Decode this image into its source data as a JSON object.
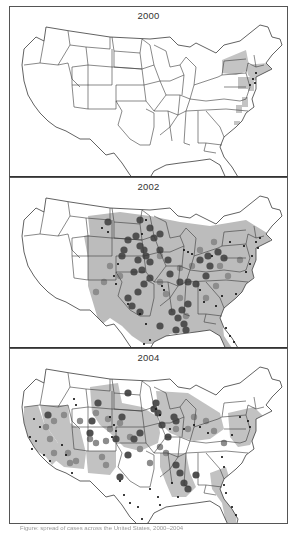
{
  "figure": {
    "panels": [
      {
        "year_label": "2000",
        "fill_color": "#c4c4c4",
        "shaded_regions": [
          {
            "name": "new-york",
            "points": "212,45 236,35 240,55 226,60 212,58"
          },
          {
            "name": "new-england",
            "points": "236,50 258,48 262,56 244,66 238,60"
          },
          {
            "name": "new-jersey",
            "points": "238,62 244,62 244,76 238,76"
          },
          {
            "name": "pennsylvania-east",
            "points": "228,62 238,62 238,74 228,74"
          },
          {
            "name": "maryland-spot",
            "points": "232,82 238,82 238,92 232,92"
          },
          {
            "name": "virginia-spot",
            "points": "226,90 232,90 232,98 226,98"
          },
          {
            "name": "nc-spot",
            "points": "224,106 230,106 230,110 224,110"
          }
        ],
        "circles_medium": [],
        "circles_dark": [],
        "dots": [
          [
            243,
            64
          ],
          [
            245,
            68
          ],
          [
            240,
            70
          ],
          [
            246,
            58
          ]
        ]
      },
      {
        "year_label": "2002",
        "fill_color": "#bcbcbc",
        "shaded_regions": [
          {
            "name": "central-east",
            "points": "78,30 110,26 140,30 170,36 200,40 236,34 262,50 256,64 246,80 242,96 238,110 226,120 212,132 214,150 226,168 210,170 200,150 182,146 160,148 150,158 134,158 122,150 112,140 100,132 90,140 84,120 78,100 78,70 80,50"
          },
          {
            "name": "west-patch",
            "points": "74,50 92,46 92,70 78,72"
          }
        ],
        "circles_medium": [
          [
            100,
            80
          ],
          [
            110,
            90
          ],
          [
            150,
            96
          ],
          [
            170,
            82
          ],
          [
            182,
            80
          ],
          [
            156,
            108
          ],
          [
            170,
            112
          ],
          [
            176,
            130
          ],
          [
            196,
            112
          ],
          [
            206,
            100
          ],
          [
            218,
            90
          ],
          [
            190,
            64
          ],
          [
            204,
            56
          ],
          [
            150,
            70
          ],
          [
            94,
            96
          ],
          [
            86,
            106
          ],
          [
            210,
            80
          ],
          [
            230,
            74
          ]
        ],
        "circles_dark": [
          [
            98,
            36
          ],
          [
            130,
            34
          ],
          [
            140,
            42
          ],
          [
            126,
            50
          ],
          [
            118,
            54
          ],
          [
            130,
            60
          ],
          [
            134,
            64
          ],
          [
            136,
            70
          ],
          [
            128,
            74
          ],
          [
            140,
            76
          ],
          [
            124,
            86
          ],
          [
            132,
            84
          ],
          [
            140,
            92
          ],
          [
            134,
            98
          ],
          [
            128,
            106
          ],
          [
            118,
            112
          ],
          [
            122,
            120
          ],
          [
            130,
            126
          ],
          [
            168,
            132
          ],
          [
            172,
            124
          ],
          [
            178,
            118
          ],
          [
            174,
            138
          ],
          [
            166,
            144
          ],
          [
            162,
            126
          ],
          [
            150,
            140
          ],
          [
            176,
            144
          ],
          [
            158,
            74
          ],
          [
            150,
            64
          ],
          [
            114,
            64
          ],
          [
            112,
            70
          ],
          [
            144,
            52
          ],
          [
            150,
            48
          ],
          [
            190,
            74
          ],
          [
            198,
            70
          ],
          [
            200,
            80
          ],
          [
            208,
            66
          ],
          [
            214,
            72
          ],
          [
            196,
            90
          ],
          [
            186,
            98
          ],
          [
            178,
            96
          ],
          [
            170,
            96
          ],
          [
            160,
            88
          ]
        ],
        "dots": [
          [
            92,
            42
          ],
          [
            98,
            46
          ],
          [
            108,
            78
          ],
          [
            104,
            90
          ],
          [
            106,
            98
          ],
          [
            136,
            34
          ],
          [
            132,
            48
          ],
          [
            174,
            64
          ],
          [
            178,
            66
          ],
          [
            182,
            68
          ],
          [
            202,
            70
          ],
          [
            220,
            56
          ],
          [
            234,
            60
          ],
          [
            246,
            56
          ],
          [
            250,
            52
          ],
          [
            248,
            62
          ],
          [
            242,
            70
          ],
          [
            240,
            78
          ],
          [
            236,
            86
          ],
          [
            226,
            108
          ],
          [
            212,
            110
          ],
          [
            206,
            120
          ],
          [
            220,
            150
          ],
          [
            224,
            156
          ],
          [
            226,
            164
          ],
          [
            216,
            142
          ],
          [
            118,
            118
          ],
          [
            130,
            128
          ],
          [
            136,
            138
          ],
          [
            140,
            154
          ],
          [
            134,
            158
          ],
          [
            152,
            100
          ],
          [
            154,
            104
          ],
          [
            190,
            104
          ],
          [
            194,
            116
          ]
        ]
      },
      {
        "year_label": "2004",
        "fill_color": "#c2c2c2",
        "shaded_regions": [
          {
            "name": "california",
            "points": "14,50 28,48 34,66 48,86 50,100 42,108 36,100 24,92 18,80 14,66"
          },
          {
            "name": "nevada-arizona",
            "points": "30,48 58,48 60,66 70,72 76,96 74,112 54,110 44,102 48,86 34,66"
          },
          {
            "name": "new-mexico",
            "points": "76,94 106,94 106,110 100,118 78,116"
          },
          {
            "name": "plains",
            "points": "80,30 108,26 112,46 132,50 148,60 150,76 148,86 130,94 114,90 100,76 90,68 82,56"
          },
          {
            "name": "midwest",
            "points": "146,34 178,36 210,56 214,72 200,82 184,84 170,80 160,76 150,66"
          },
          {
            "name": "south-central",
            "points": "150,96 176,96 180,116 186,130 176,140 162,140 156,126 150,110"
          },
          {
            "name": "east-coast",
            "points": "218,56 244,50 254,60 248,74 240,88 228,90 220,80"
          },
          {
            "name": "florida-ga",
            "points": "200,116 216,110 222,130 228,150 226,166 216,166 212,146 202,132"
          }
        ],
        "circles_medium": [
          [
            36,
            70
          ],
          [
            40,
            82
          ],
          [
            44,
            96
          ],
          [
            58,
            96
          ],
          [
            60,
            106
          ],
          [
            66,
            104
          ],
          [
            80,
            82
          ],
          [
            86,
            86
          ],
          [
            96,
            84
          ],
          [
            92,
            100
          ],
          [
            96,
            108
          ],
          [
            100,
            72
          ],
          [
            110,
            66
          ],
          [
            120,
            80
          ],
          [
            130,
            92
          ],
          [
            140,
            106
          ],
          [
            150,
            90
          ],
          [
            156,
            96
          ],
          [
            166,
            72
          ],
          [
            178,
            72
          ],
          [
            184,
            60
          ],
          [
            196,
            64
          ],
          [
            204,
            74
          ],
          [
            214,
            86
          ],
          [
            44,
            64
          ],
          [
            54,
            58
          ],
          [
            70,
            64
          ],
          [
            86,
            56
          ],
          [
            98,
            62
          ]
        ],
        "circles_dark": [
          [
            118,
            36
          ],
          [
            88,
            46
          ],
          [
            112,
            60
          ],
          [
            38,
            58
          ],
          [
            82,
            64
          ],
          [
            80,
            76
          ],
          [
            124,
            82
          ],
          [
            130,
            76
          ],
          [
            118,
            98
          ],
          [
            106,
            82
          ],
          [
            110,
            120
          ],
          [
            152,
            68
          ],
          [
            146,
            46
          ],
          [
            164,
            60
          ],
          [
            166,
            64
          ],
          [
            158,
            80
          ],
          [
            166,
            108
          ],
          [
            170,
            116
          ],
          [
            174,
            126
          ],
          [
            178,
            132
          ],
          [
            186,
            118
          ],
          [
            148,
            56
          ],
          [
            144,
            52
          ]
        ],
        "dots": [
          [
            24,
            62
          ],
          [
            30,
            70
          ],
          [
            20,
            80
          ],
          [
            26,
            84
          ],
          [
            22,
            92
          ],
          [
            34,
            98
          ],
          [
            40,
            104
          ],
          [
            52,
            88
          ],
          [
            56,
            98
          ],
          [
            62,
            116
          ],
          [
            100,
            60
          ],
          [
            104,
            68
          ],
          [
            106,
            74
          ],
          [
            102,
            80
          ],
          [
            64,
            42
          ],
          [
            66,
            48
          ],
          [
            146,
            52
          ],
          [
            150,
            58
          ],
          [
            160,
            72
          ],
          [
            174,
            72
          ],
          [
            184,
            68
          ],
          [
            190,
            70
          ],
          [
            198,
            76
          ],
          [
            222,
            78
          ],
          [
            230,
            60
          ],
          [
            238,
            64
          ],
          [
            240,
            70
          ],
          [
            212,
            100
          ],
          [
            214,
            110
          ],
          [
            214,
            128
          ],
          [
            216,
            136
          ],
          [
            222,
            150
          ],
          [
            226,
            158
          ],
          [
            148,
            140
          ],
          [
            150,
            148
          ],
          [
            140,
            132
          ],
          [
            128,
            150
          ],
          [
            120,
            146
          ],
          [
            114,
            138
          ],
          [
            110,
            124
          ],
          [
            132,
            162
          ],
          [
            162,
            126
          ],
          [
            168,
            140
          ]
        ]
      }
    ],
    "caption": "Figure: spread of cases across the United States, 2000–2004"
  },
  "colors": {
    "state_outline": "#3a3a3a",
    "fill_light": "#c4c4c4",
    "circle_medium": "#8c8c8c",
    "circle_dark": "#505050",
    "dot": "#111111",
    "frame": "#555555"
  }
}
